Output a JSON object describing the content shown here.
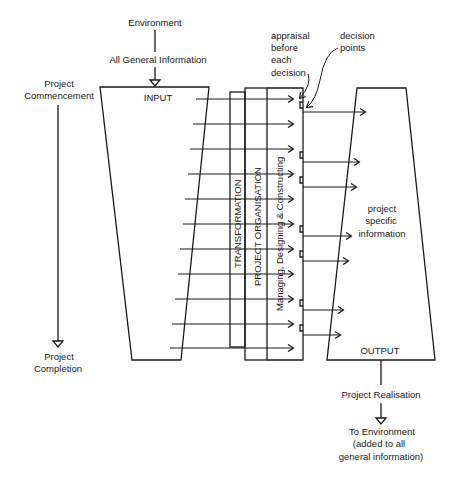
{
  "diagram": {
    "top": {
      "environment": "Environment",
      "general_info": "All General Information",
      "input": "INPUT"
    },
    "left": {
      "commencement_line1": "Project",
      "commencement_line2": "Commencement",
      "completion_line1": "Project",
      "completion_line2": "Completion"
    },
    "annotations": {
      "appraisal": [
        "appraisal",
        "before",
        "each",
        "decision"
      ],
      "decision_points": [
        "decision",
        "points"
      ]
    },
    "center": {
      "transformation": "TRANSFORMATION",
      "organisation": "PROJECT ORGANISATION",
      "activities": "Managing, Designing & Constructing"
    },
    "right": {
      "specific_info": [
        "project",
        "specific",
        "information"
      ],
      "output": "OUTPUT"
    },
    "bottom": {
      "realisation": "Project Realisation",
      "to_environment": [
        "To Environment",
        "(added to all",
        "general information)"
      ]
    },
    "colors": {
      "ink": "#1a1a1a",
      "background": "#ffffff"
    }
  }
}
